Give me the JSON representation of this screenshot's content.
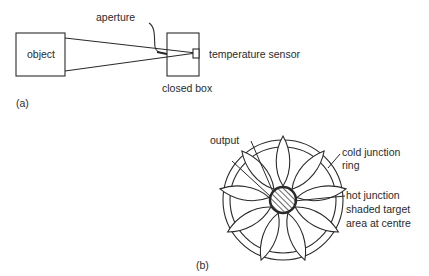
{
  "diagram_a": {
    "caption": "(a)",
    "labels": {
      "object": "object",
      "aperture": "aperture",
      "temperature_sensor": "temperature sensor",
      "closed_box": "closed box"
    }
  },
  "diagram_b": {
    "caption": "(b)",
    "labels": {
      "output": "output",
      "cold_junction_line1": "cold junction",
      "cold_junction_line2": "ring",
      "hot_junction": "hot junction",
      "shaded_target_line1": "shaded target",
      "shaded_target_line2": "area at centre"
    }
  },
  "colors": {
    "ink": "#2a2a2a",
    "background": "#ffffff"
  }
}
